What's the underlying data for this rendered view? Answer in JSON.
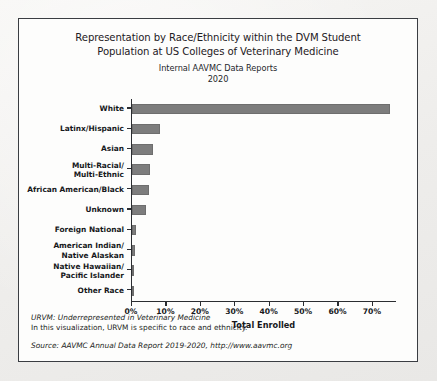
{
  "chart_data": {
    "type": "bar",
    "orientation": "horizontal",
    "title": "Representation by Race/Ethnicity within the DVM Student Population at US Colleges of Veterinary Medicine",
    "title_lines": [
      "Representation by Race/Ethnicity within the DVM Student",
      "Population at US Colleges of Veterinary Medicine"
    ],
    "subtitle_lines": [
      "Internal AAVMC Data Reports",
      "2020"
    ],
    "xlabel": "Total Enrolled",
    "ylabel": "",
    "categories": [
      "White",
      "Latinx/Hispanic",
      "Asian",
      "Multi-Racial/ Multi-Ethnic",
      "African American/Black",
      "Unknown",
      "Foreign National",
      "American Indian/ Native Alaskan",
      "Native Hawaiian/ Pacific Islander",
      "Other Race"
    ],
    "category_lines": [
      [
        "White"
      ],
      [
        "Latinx/Hispanic"
      ],
      [
        "Asian"
      ],
      [
        "Multi-Racial/",
        "Multi-Ethnic"
      ],
      [
        "African American/Black"
      ],
      [
        "Unknown"
      ],
      [
        "Foreign National"
      ],
      [
        "American Indian/",
        "Native Alaskan"
      ],
      [
        "Native Hawaiian/",
        "Pacific Islander"
      ],
      [
        "Other Race"
      ]
    ],
    "values": [
      75.0,
      8.0,
      6.2,
      5.3,
      4.8,
      4.0,
      1.2,
      1.0,
      0.4,
      0.4
    ],
    "value_unit": "%",
    "xlim": [
      0,
      77
    ],
    "xticks": [
      0,
      10,
      20,
      30,
      40,
      50,
      60,
      70
    ],
    "xtick_labels": [
      "0%",
      "10%",
      "20%",
      "30%",
      "40%",
      "50%",
      "60%",
      "70%"
    ],
    "grid": false,
    "legend": false,
    "bar_color": "#7d7d7d",
    "axis_color": "#2b2d31"
  },
  "notes": {
    "line1": "URVM: Underrepresented in Veterinary Medicine",
    "line2": "In this visualization, URVM is specific to race and ethnicity.",
    "source": "Source: AAVMC Annual Data Report 2019-2020, http://www.aavmc.org"
  }
}
